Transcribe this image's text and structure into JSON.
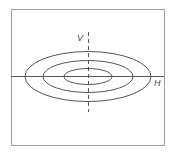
{
  "diagram": {
    "labels": {
      "vertical": "V",
      "horizontal": "H"
    },
    "caption": "",
    "colors": {
      "stroke": "#555555",
      "frame": "#999999",
      "background": "#ffffff"
    },
    "frame": {
      "x": 11,
      "y": 9,
      "width": 153,
      "height": 136
    },
    "center": {
      "x": 88,
      "y": 76
    },
    "ellipses": [
      {
        "name": "inner",
        "rx": 24,
        "ry": 8
      },
      {
        "name": "middle",
        "rx": 45,
        "ry": 16
      },
      {
        "name": "outer",
        "rx": 63,
        "ry": 25
      }
    ],
    "axes": {
      "horizontal": {
        "x1": 11,
        "x2": 164,
        "y": 76,
        "style": "solid"
      },
      "vertical": {
        "x": 88,
        "y1": 32,
        "y2": 112,
        "style": "dashed"
      }
    }
  }
}
